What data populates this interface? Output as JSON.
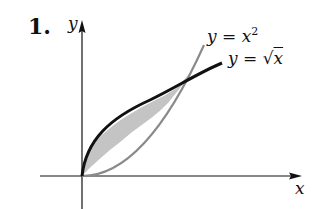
{
  "problem": {
    "number": "1."
  },
  "axes": {
    "x_label": "x",
    "y_label": "y"
  },
  "curves": [
    {
      "name": "parabola",
      "label_lhs": "y",
      "label_eq": "=",
      "label_var": "x",
      "label_exp": "2",
      "color": "#8a8a8a"
    },
    {
      "name": "sqrt",
      "label_lhs": "y",
      "label_eq": "=",
      "label_sqrt": "√",
      "label_var": "x",
      "color": "#111111"
    }
  ],
  "region": {
    "fill": "#c8c8c8",
    "description": "region between y = x^2 and y = sqrt(x) from x=0 to x=1"
  }
}
